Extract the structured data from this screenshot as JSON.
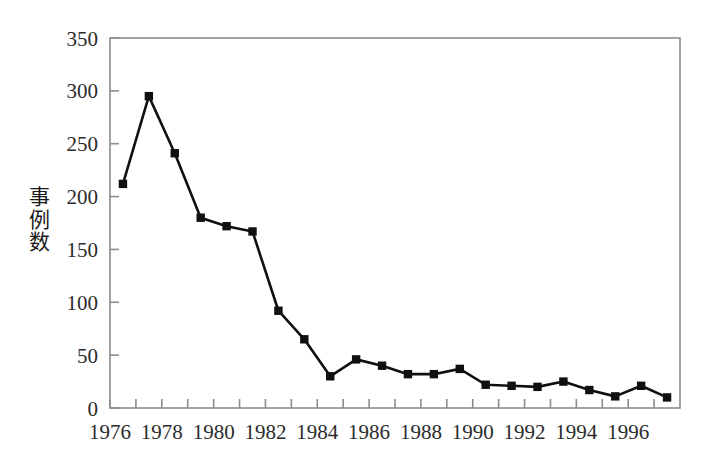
{
  "chart_data": {
    "type": "line",
    "title": "",
    "subtitle": "",
    "xlabel": "",
    "ylabel": "事例数",
    "ylabel_chars": [
      "事",
      "例",
      "数"
    ],
    "x": [
      1976,
      1977,
      1978,
      1979,
      1980,
      1981,
      1982,
      1983,
      1984,
      1985,
      1986,
      1987,
      1988,
      1989,
      1990,
      1991,
      1992,
      1993,
      1994,
      1995,
      1996,
      1997
    ],
    "values": [
      212,
      295,
      241,
      180,
      172,
      167,
      92,
      65,
      30,
      46,
      40,
      32,
      32,
      37,
      22,
      21,
      20,
      25,
      17,
      11,
      21,
      10
    ],
    "series": [
      {
        "name": "事例数",
        "values": [
          212,
          295,
          241,
          180,
          172,
          167,
          92,
          65,
          30,
          46,
          40,
          32,
          32,
          37,
          22,
          21,
          20,
          25,
          17,
          11,
          21,
          10
        ]
      }
    ],
    "ylim": [
      0,
      350
    ],
    "xlim": [
      1976,
      1998
    ],
    "ytick_labels": [
      "0",
      "50",
      "100",
      "150",
      "200",
      "250",
      "300",
      "350"
    ],
    "ytick_values": [
      0,
      50,
      100,
      150,
      200,
      250,
      300,
      350
    ],
    "xtick_labels": [
      "1976",
      "1978",
      "1980",
      "1982",
      "1984",
      "1986",
      "1988",
      "1990",
      "1992",
      "1994",
      "1996"
    ],
    "xtick_values": [
      1976,
      1978,
      1980,
      1982,
      1984,
      1986,
      1988,
      1990,
      1992,
      1994,
      1996
    ],
    "xtick_minor_values": [
      1977,
      1979,
      1981,
      1983,
      1985,
      1987,
      1989,
      1991,
      1993,
      1995,
      1997
    ],
    "grid": false,
    "legend": false,
    "legend_position": "none",
    "marker": "square",
    "line_color": "#101010",
    "marker_color": "#101010",
    "axis_color": "#8d8d8d",
    "background_color": "#ffffff",
    "annotations": []
  }
}
